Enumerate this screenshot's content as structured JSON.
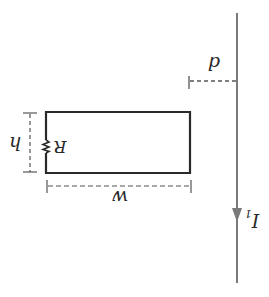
{
  "diagram": {
    "orientation": "rotated-180",
    "labels": {
      "distance": "d",
      "height": "h",
      "width": "w",
      "resistor": "R",
      "current_main": "I",
      "current_sub": "1"
    },
    "colors": {
      "wire": "#7a7a7a",
      "loop": "#2a2a2a",
      "dimension": "#555555"
    }
  }
}
